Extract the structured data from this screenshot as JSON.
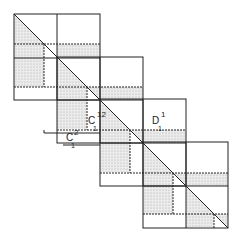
{
  "diagram": {
    "type": "staircase block matrix partition",
    "stroke_color": "#222222",
    "fill_color": "#d8d8d8",
    "background": "#ffffff",
    "labels": [
      {
        "id": "c1-12",
        "base": "C",
        "sub": "1",
        "sup": "12"
      },
      {
        "id": "d1-1",
        "base": "D",
        "sub": "1",
        "sup": "1"
      },
      {
        "id": "c1-2",
        "base": "C",
        "sub": "1",
        "sup": "2"
      }
    ],
    "blocks": [
      {
        "index": 1,
        "x": 14,
        "y": 14,
        "size": 86
      },
      {
        "index": 2,
        "x": 57,
        "y": 57,
        "size": 86
      },
      {
        "index": 3,
        "x": 100,
        "y": 99,
        "size": 86
      },
      {
        "index": 4,
        "x": 143,
        "y": 142,
        "size": 85
      }
    ]
  }
}
